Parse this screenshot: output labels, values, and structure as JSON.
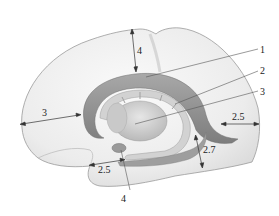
{
  "diagram": {
    "colors": {
      "background": "#ffffff",
      "cortex_fill": "#ececec",
      "cortex_outline": "#9a9a9a",
      "structure_dark": "#8a8a8a",
      "structure_mid": "#b5b5b5",
      "structure_light": "#d6d6d6",
      "leader_line": "#555555",
      "text": "#222222"
    },
    "callouts": [
      {
        "id": "1",
        "label": "1"
      },
      {
        "id": "2",
        "label": "2"
      },
      {
        "id": "3",
        "label": "3"
      },
      {
        "id": "4",
        "label": "4"
      }
    ],
    "measurements": [
      {
        "id": "top",
        "label": "4"
      },
      {
        "id": "left",
        "label": "3"
      },
      {
        "id": "right",
        "label": "2.5"
      },
      {
        "id": "right-lower",
        "label": "2.7"
      },
      {
        "id": "bottom",
        "label": "2.5"
      }
    ]
  }
}
